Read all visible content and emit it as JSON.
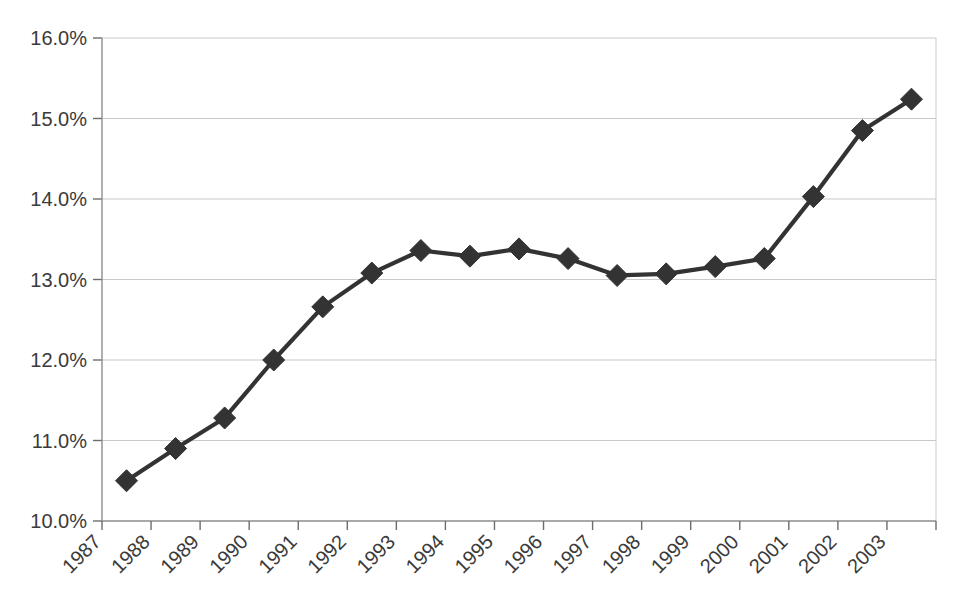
{
  "chart_data": {
    "type": "line",
    "title": "",
    "subtitle": "",
    "xlabel": "",
    "ylabel": "",
    "categories": [
      "1987",
      "1988",
      "1989",
      "1990",
      "1991",
      "1992",
      "1993",
      "1994",
      "1995",
      "1996",
      "1997",
      "1998",
      "1999",
      "2000",
      "2001",
      "2002",
      "2003"
    ],
    "values": [
      10.5,
      10.9,
      11.28,
      12.0,
      12.66,
      13.08,
      13.36,
      13.29,
      13.38,
      13.26,
      13.05,
      13.07,
      13.16,
      13.26,
      14.03,
      14.85,
      15.24
    ],
    "series": [
      {
        "name": "",
        "values": [
          10.5,
          10.9,
          11.28,
          12.0,
          12.66,
          13.08,
          13.36,
          13.29,
          13.38,
          13.26,
          13.05,
          13.07,
          13.16,
          13.26,
          14.03,
          14.85,
          15.24
        ]
      }
    ],
    "ylim": [
      10.0,
      16.0
    ],
    "ytick_values": [
      10.0,
      11.0,
      12.0,
      13.0,
      14.0,
      15.0,
      16.0
    ],
    "ytick_labels": [
      "10.0%",
      "11.0%",
      "12.0%",
      "13.0%",
      "14.0%",
      "15.0%",
      "16.0%"
    ],
    "xtick_labels": [
      "1987",
      "1988",
      "1989",
      "1990",
      "1991",
      "1992",
      "1993",
      "1994",
      "1995",
      "1996",
      "1997",
      "1998",
      "1999",
      "2000",
      "2001",
      "2002",
      "2003"
    ],
    "xtick_label_rotation": -45,
    "grid": "horizontal",
    "legend": "none",
    "marker": "diamond",
    "series_color": "#333333",
    "gridline_color": "#c9c9c9",
    "axis_color": "#8d8d8d",
    "label_color": "#3a3a3a",
    "background_color": "#ffffff"
  }
}
